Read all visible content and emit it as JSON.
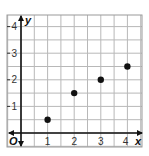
{
  "chart_data": {
    "type": "scatter",
    "title": "",
    "xlabel": "x",
    "ylabel": "y",
    "origin_label": "O",
    "x": [
      1,
      2,
      3,
      4
    ],
    "y": [
      0.5,
      1.5,
      2,
      2.5
    ],
    "series": [
      {
        "name": "points",
        "x": [
          1,
          2,
          3,
          4
        ],
        "y": [
          0.5,
          1.5,
          2,
          2.5
        ]
      }
    ],
    "xticks": [
      "1",
      "2",
      "3",
      "4"
    ],
    "yticks": [
      "1",
      "2",
      "3",
      "4"
    ],
    "xlim": [
      -0.5,
      4.5
    ],
    "ylim": [
      -0.5,
      4.5
    ],
    "grid": true,
    "grid_step": 0.5,
    "legend": null
  },
  "colors": {
    "grid": "#b8b8b8",
    "axis": "#111111",
    "point": "#111111",
    "text": "#333333",
    "border": "#9a9a9a"
  }
}
